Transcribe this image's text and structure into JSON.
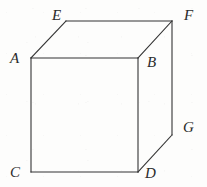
{
  "figure": {
    "name": "cube-diagram",
    "canvas": {
      "width": 207,
      "height": 187
    },
    "background_color": "#fdfdfc",
    "stroke_color": "#333333",
    "stroke_width": 1.1,
    "label_color": "#2b2b2b",
    "label_font_size": 15,
    "label_style": "italic-serif"
  },
  "vertices": [
    {
      "id": "A",
      "label": "A",
      "x": 31,
      "y": 58,
      "label_x": 10,
      "label_y": 51,
      "role": "front-top-left"
    },
    {
      "id": "B",
      "label": "B",
      "x": 138,
      "y": 58,
      "label_x": 147,
      "label_y": 55,
      "role": "front-top-right"
    },
    {
      "id": "C",
      "label": "C",
      "x": 31,
      "y": 172,
      "label_x": 10,
      "label_y": 165,
      "role": "front-bottom-left"
    },
    {
      "id": "D",
      "label": "D",
      "x": 138,
      "y": 172,
      "label_x": 145,
      "label_y": 166,
      "role": "front-bottom-right"
    },
    {
      "id": "E",
      "label": "E",
      "x": 66,
      "y": 21,
      "label_x": 52,
      "label_y": 8,
      "role": "back-top-left"
    },
    {
      "id": "F",
      "label": "F",
      "x": 172,
      "y": 21,
      "label_x": 184,
      "label_y": 8,
      "role": "back-top-right"
    },
    {
      "id": "G",
      "label": "G",
      "x": 172,
      "y": 135,
      "label_x": 183,
      "label_y": 120,
      "role": "back-bottom-right"
    }
  ],
  "edges": [
    {
      "id": "AB",
      "from": "A",
      "to": "B",
      "kind": "visible",
      "face": "front-top"
    },
    {
      "id": "BD",
      "from": "B",
      "to": "D",
      "kind": "visible",
      "face": "front-right"
    },
    {
      "id": "DC",
      "from": "D",
      "to": "C",
      "kind": "visible",
      "face": "front-bottom"
    },
    {
      "id": "CA",
      "from": "C",
      "to": "A",
      "kind": "visible",
      "face": "front-left"
    },
    {
      "id": "AE",
      "from": "A",
      "to": "E",
      "kind": "visible",
      "face": "top-left-receding"
    },
    {
      "id": "EF",
      "from": "E",
      "to": "F",
      "kind": "visible",
      "face": "top-back"
    },
    {
      "id": "FB",
      "from": "F",
      "to": "B",
      "kind": "visible",
      "face": "top-right-receding"
    },
    {
      "id": "FG",
      "from": "F",
      "to": "G",
      "kind": "visible",
      "face": "right-back"
    },
    {
      "id": "GD",
      "from": "G",
      "to": "D",
      "kind": "visible",
      "face": "right-bottom-receding"
    }
  ]
}
